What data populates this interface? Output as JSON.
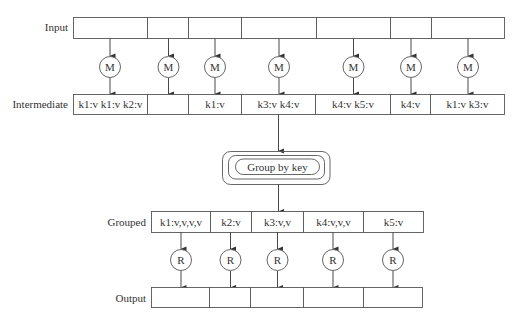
{
  "diagram": {
    "type": "mapreduce-flow",
    "rows": {
      "input": {
        "label": "Input",
        "cells": [
          "",
          "",
          "",
          "",
          "",
          "",
          ""
        ]
      },
      "intermediate": {
        "label": "Intermediate",
        "cells": [
          "k1:v k1:v k2:v",
          "",
          "k1:v",
          "k3:v k4:v",
          "k4:v k5:v",
          "k4:v",
          "k1:v k3:v"
        ]
      },
      "grouped": {
        "label": "Grouped",
        "cells": [
          "k1:v,v,v,v",
          "k2:v",
          "k3:v,v",
          "k4:v,v,v",
          "k5:v"
        ]
      },
      "output": {
        "label": "Output",
        "cells": [
          "",
          "",
          "",
          "",
          ""
        ]
      }
    },
    "map_node_label": "M",
    "reduce_node_label": "R",
    "group_step": {
      "label": "Group by key"
    },
    "colors": {
      "stroke": "#555555",
      "text": "#333333",
      "background": "#ffffff"
    }
  }
}
